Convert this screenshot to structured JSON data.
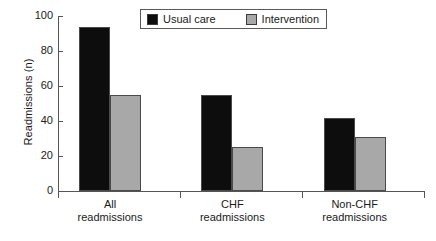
{
  "chart_data": {
    "type": "bar",
    "title": "",
    "xlabel": "",
    "ylabel": "Readmissions (n)",
    "ylim": [
      0,
      100
    ],
    "yticks": [
      0,
      20,
      40,
      60,
      80,
      100
    ],
    "ytick_labels": [
      "0",
      "20",
      "40",
      "60",
      "80",
      "100"
    ],
    "grid": false,
    "legend_position": "top-center",
    "categories": [
      "All readmissions",
      "CHF readmissions",
      "Non-CHF readmissions"
    ],
    "category_lines": [
      [
        "All",
        "readmissions"
      ],
      [
        "CHF",
        "readmissions"
      ],
      [
        "Non-CHF",
        "readmissions"
      ]
    ],
    "series": [
      {
        "name": "Usual care",
        "color": "#0d0d0d",
        "values": [
          94,
          55,
          42
        ]
      },
      {
        "name": "Intervention",
        "color": "#a8a8a8",
        "values": [
          55,
          25,
          31
        ]
      }
    ]
  },
  "legend": {
    "items": [
      {
        "label": "Usual care",
        "swatch": "black-swatch"
      },
      {
        "label": "Intervention",
        "swatch": "gray-swatch"
      }
    ]
  }
}
